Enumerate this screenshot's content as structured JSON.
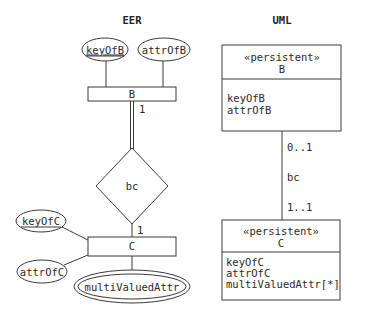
{
  "eer": {
    "heading": "EER",
    "entity_b": {
      "name": "B",
      "attributes": [
        {
          "name": "keyOfB",
          "key": true
        },
        {
          "name": "attrOfB",
          "key": false
        }
      ]
    },
    "relationship": {
      "name": "bc",
      "card_b": "1",
      "card_c": "1"
    },
    "entity_c": {
      "name": "C",
      "attributes": [
        {
          "name": "keyOfC",
          "key": true
        },
        {
          "name": "attrOfC",
          "key": false
        }
      ],
      "multivalued": "multiValuedAttr"
    }
  },
  "uml": {
    "heading": "UML",
    "class_b": {
      "stereotype": "«persistent»",
      "name": "B",
      "attributes": [
        "keyOfB",
        "attrOfB"
      ]
    },
    "association": {
      "name": "bc",
      "mult_b": "0..1",
      "mult_c": "1..1"
    },
    "class_c": {
      "stereotype": "«persistent»",
      "name": "C",
      "attributes": [
        "keyOfC",
        "attrOfC",
        "multiValuedAttr[*]"
      ]
    }
  }
}
